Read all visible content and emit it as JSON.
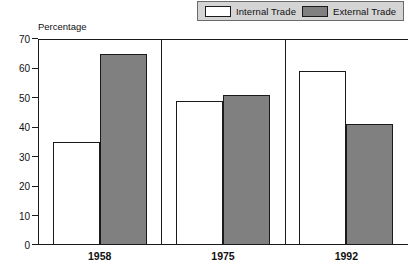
{
  "chart_data": {
    "type": "bar",
    "title": "",
    "subtitle": "",
    "xlabel": "",
    "ylabel": "Percentage",
    "ylim": [
      0,
      70
    ],
    "yticks": [
      0,
      10,
      20,
      30,
      40,
      50,
      60,
      70
    ],
    "ytick_labels": [
      "0",
      "10",
      "20",
      "30",
      "40",
      "50",
      "60",
      "70"
    ],
    "categories": [
      "1958",
      "1975",
      "1992"
    ],
    "grid": false,
    "legend_position": "top-right",
    "series": [
      {
        "name": "Internal Trade",
        "color": "#ffffff",
        "values": [
          35,
          49,
          59
        ]
      },
      {
        "name": "External Trade",
        "color": "#808080",
        "values": [
          65,
          51,
          41
        ]
      }
    ]
  },
  "legend": {
    "items": [
      {
        "label": "Internal Trade",
        "swatch": "internal"
      },
      {
        "label": "External Trade",
        "swatch": "external"
      }
    ]
  },
  "axes": {
    "y_axis_title": "Percentage"
  },
  "colors": {
    "internal_fill": "#ffffff",
    "external_fill": "#808080",
    "outline": "#1a1a1a",
    "legend_background": "#d4d4d4",
    "text": "#101010"
  }
}
